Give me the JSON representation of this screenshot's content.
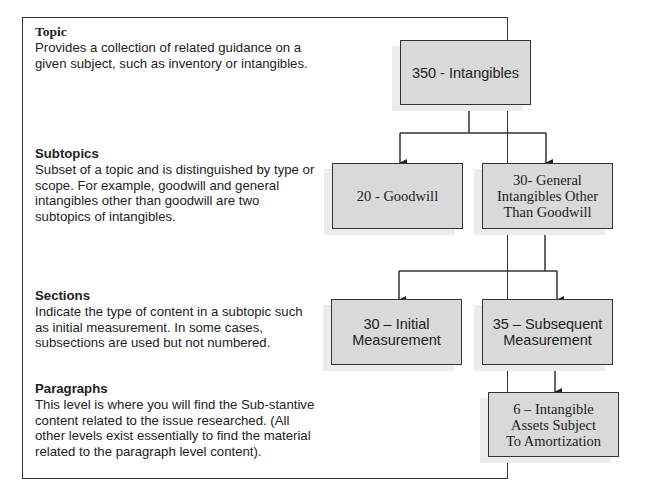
{
  "levels": [
    {
      "heading": "Topic",
      "description": "Provides a collection of related guidance on a given subject, such as inventory or intangibles."
    },
    {
      "heading": "Subtopics",
      "description": "Subset of a topic and is distinguished by type or scope. For example, goodwill and general intangibles other than goodwill are two subtopics of intangibles."
    },
    {
      "heading": "Sections",
      "description": "Indicate the type of content in a subtopic such as initial measurement. In some cases, subsections are used but not numbered."
    },
    {
      "heading": "Paragraphs",
      "description": "This level is where you will find the Sub-stantive content related to the issue researched. (All other levels exist essentially to find the material related to the paragraph level content)."
    }
  ],
  "tree": {
    "topic": "350 - Intangibles",
    "subtopics": [
      "20 - Goodwill",
      "30- General\nIntangibles Other\nThan Goodwill"
    ],
    "sections": [
      "30 – Initial\nMeasurement",
      "35 – Subsequent\nMeasurement"
    ],
    "paragraph": "6 – Intangible\nAssets Subject\nTo Amortization"
  },
  "colors": {
    "box_fill": "#d9d9d9",
    "border": "#333333"
  }
}
